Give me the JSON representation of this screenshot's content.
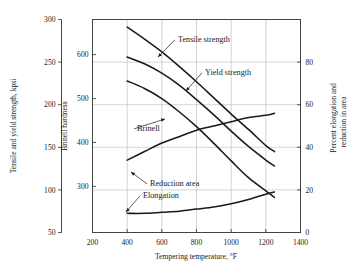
{
  "chart_data": {
    "type": "line",
    "title": "",
    "xlabel": "Tempering temperature, °F",
    "xlim": [
      200,
      1400
    ],
    "xticks": [
      200,
      400,
      600,
      800,
      1000,
      1200,
      1400
    ],
    "grid": true,
    "legend_position": "inline-annotations",
    "axes": [
      {
        "id": "left",
        "ylabel": "Tensile and yield strength, kpsi",
        "ylim": [
          50,
          300
        ],
        "yticks": [
          50,
          100,
          150,
          200,
          250,
          300
        ]
      },
      {
        "id": "brinell",
        "ylabel": "Brinell hardness",
        "ylim": [
          195,
          680
        ],
        "yticks": [
          300,
          400,
          500,
          600
        ]
      },
      {
        "id": "right",
        "ylabel": "Percent elongation and reduction in area",
        "ylim": [
          0,
          100
        ],
        "yticks": [
          0,
          20,
          40,
          60,
          80
        ]
      }
    ],
    "series": [
      {
        "name": "Tensile strength",
        "axis": "left",
        "units": "kpsi",
        "x": [
          400,
          500,
          600,
          700,
          800,
          900,
          1000,
          1100,
          1200,
          1250
        ],
        "values": [
          291,
          277,
          262,
          245,
          227,
          208,
          189,
          171,
          152,
          145
        ]
      },
      {
        "name": "Yield strength",
        "axis": "left",
        "units": "kpsi",
        "x": [
          400,
          500,
          600,
          700,
          800,
          900,
          1000,
          1100,
          1200,
          1250
        ],
        "values": [
          256,
          248,
          237,
          223,
          206,
          188,
          169,
          151,
          135,
          128
        ]
      },
      {
        "name": "Brinell",
        "axis": "brinell",
        "units": "HB",
        "x": [
          400,
          500,
          600,
          700,
          800,
          900,
          1000,
          1100,
          1200,
          1250
        ],
        "values": [
          540,
          523,
          500,
          470,
          436,
          398,
          358,
          320,
          290,
          275
        ]
      },
      {
        "name": "Reduction area",
        "axis": "right",
        "units": "percent",
        "x": [
          400,
          500,
          600,
          700,
          800,
          900,
          1000,
          1100,
          1200,
          1250
        ],
        "values": [
          34,
          38,
          42,
          45,
          48,
          50,
          52,
          54,
          55,
          56
        ]
      },
      {
        "name": "Elongation",
        "axis": "right",
        "units": "percent",
        "x": [
          400,
          500,
          600,
          700,
          800,
          900,
          1000,
          1100,
          1200,
          1250
        ],
        "values": [
          9,
          9,
          9.5,
          10,
          11,
          12,
          13.5,
          15.5,
          18,
          19
        ]
      }
    ],
    "annotations": [
      {
        "name": "Tensile strength",
        "text_x": 178,
        "text_y": 42,
        "point_x": 158,
        "point_y": 57
      },
      {
        "name": "Yield strength",
        "text_x": 205,
        "text_y": 75,
        "point_x": 186,
        "point_y": 91
      },
      {
        "name": "Brinell",
        "text_x": 137,
        "text_y": 131,
        "point_x": 165,
        "point_y": 119
      },
      {
        "name": "Reduction area",
        "text_x": 150,
        "text_y": 186,
        "point_x": 131,
        "point_y": 172
      },
      {
        "name": "Elongation",
        "text_x": 143,
        "text_y": 198,
        "point_x": 126,
        "point_y": 212
      }
    ],
    "colors": {
      "curve": "#1a1a1a",
      "grid": "#b9b9b9",
      "spine": "#3a3a3a",
      "background": "#ffffff"
    }
  }
}
